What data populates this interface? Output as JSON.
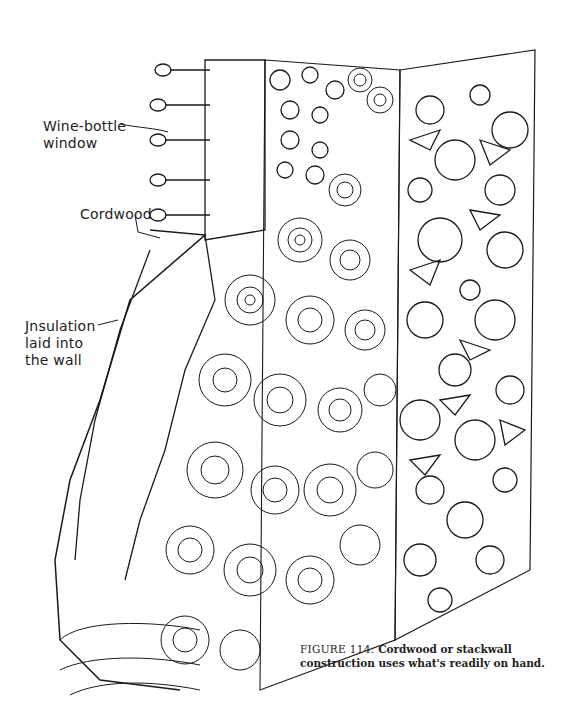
{
  "figure": {
    "labels": [
      {
        "id": "wine-bottle-window",
        "lines": [
          "Wine-bottle",
          "window"
        ]
      },
      {
        "id": "cordwood",
        "lines": [
          "Cordwood"
        ]
      },
      {
        "id": "insulation",
        "lines": [
          "Jnsulation",
          "laid into",
          "the wall"
        ]
      }
    ],
    "caption": {
      "number": "FIGURE 114:",
      "text": "Cordwood or stackwall construction uses what's readily on hand."
    },
    "colors": {
      "ink": "#1a1a1a",
      "paper": "#ffffff"
    }
  }
}
